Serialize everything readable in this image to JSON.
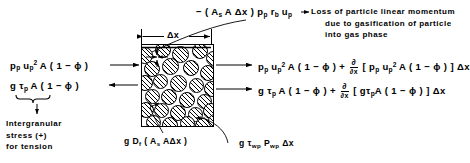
{
  "diagram": {
    "control_volume": {
      "dimension_label": "Δx",
      "particle_count": 28
    },
    "left_fluxes": [
      {
        "id": "inflow-convective-momentum",
        "parts": [
          "p",
          "p",
          " u",
          "p",
          "2",
          " A ( 1 − ϕ )"
        ],
        "text": "p_p u_p^2 A ( 1 − ϕ )",
        "arrow": "right"
      },
      {
        "id": "inflow-intergranular-stress",
        "text": "g τ_p A ( 1 − ϕ )",
        "arrow": "left"
      }
    ],
    "right_fluxes": [
      {
        "id": "outflow-convective-momentum",
        "text": "p_p u_p^2 A ( 1 − ϕ ) + ∂/∂x [ p_p u_p^2 A ( 1 − ϕ ) ] Δx",
        "arrow": "right"
      },
      {
        "id": "outflow-intergranular-stress",
        "text": "g τ_p A ( 1 − ϕ ) + ∂/∂x [ g τ_p A ( 1 − ϕ ) ] Δx",
        "arrow": "right"
      }
    ],
    "top_annotation": {
      "expression": "− ( A_s A Δx ) p_p r_b u_p",
      "description_lines": [
        "Loss of particle linear momentum",
        "due to gasification of particle",
        "into gas phase"
      ]
    },
    "intergranular_note": {
      "lines": [
        "Intergranular",
        "stress (+)",
        "for tension"
      ]
    },
    "bottom_labels": [
      {
        "id": "drag-force",
        "text": "g D_f ( A_s A Δx )"
      },
      {
        "id": "wall-friction",
        "text": "g τ_wp P_wp Δx"
      }
    ],
    "symbols": {
      "delta_x": "Δx",
      "phi": "ϕ",
      "tau": "τ",
      "partial": "∂"
    },
    "colors": {
      "ink": "#000000",
      "background": "#ffffff"
    }
  }
}
